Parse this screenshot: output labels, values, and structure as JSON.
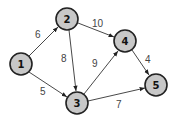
{
  "graph": {
    "type": "weighted-directed-graph",
    "colors": {
      "node_fill": "#c8c8c8",
      "node_stroke": "#222222",
      "edge": "#333333",
      "edge_label": "#444444"
    },
    "nodes": [
      {
        "id": "1",
        "label": "1"
      },
      {
        "id": "2",
        "label": "2"
      },
      {
        "id": "3",
        "label": "3"
      },
      {
        "id": "4",
        "label": "4"
      },
      {
        "id": "5",
        "label": "5"
      }
    ],
    "edges": [
      {
        "from": "1",
        "to": "2",
        "weight": "6"
      },
      {
        "from": "1",
        "to": "3",
        "weight": "5"
      },
      {
        "from": "2",
        "to": "3",
        "weight": "8"
      },
      {
        "from": "2",
        "to": "4",
        "weight": "10"
      },
      {
        "from": "3",
        "to": "4",
        "weight": "9"
      },
      {
        "from": "3",
        "to": "5",
        "weight": "7"
      },
      {
        "from": "4",
        "to": "5",
        "weight": "4"
      }
    ]
  }
}
